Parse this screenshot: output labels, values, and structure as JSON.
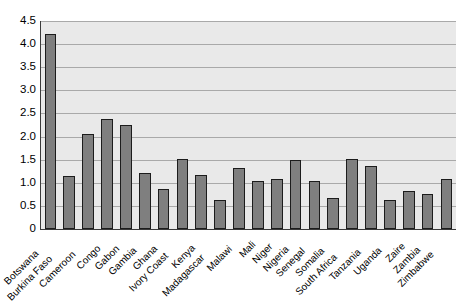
{
  "chart_data": {
    "type": "bar",
    "title": "",
    "subtitle": "",
    "xlabel": "",
    "ylabel": "",
    "ylim": [
      0,
      4.5
    ],
    "grid": true,
    "legend": false,
    "legend_position": "none",
    "orientation": "vertical",
    "bar_color": "#7f7f7f",
    "bar_edge_color": "#1c1c1c",
    "plot_background": "#e9e9e9",
    "gridline_color": "#a9a9a9",
    "axis_color": "#3a3a3a",
    "y_ticks": [
      "0",
      "0.5",
      "1.0",
      "1.5",
      "2.0",
      "2.5",
      "3.0",
      "3.5",
      "4.0",
      "4.5"
    ],
    "y_tick_values": [
      0,
      0.5,
      1.0,
      1.5,
      2.0,
      2.5,
      3.0,
      3.5,
      4.0,
      4.5
    ],
    "categories": [
      "Botswana",
      "Burkina Faso",
      "Cameroon",
      "Congo",
      "Gabon",
      "Gambia",
      "Ghana",
      "Ivory Coast",
      "Kenya",
      "Madagascar",
      "Malawi",
      "Mali",
      "Niger",
      "Nigeria",
      "Senegal",
      "Somalia",
      "South Africa",
      "Tanzania",
      "Uganda",
      "Zaire",
      "Zambia",
      "Zimbabwe"
    ],
    "values": [
      4.21,
      1.15,
      2.05,
      2.38,
      2.26,
      1.22,
      0.87,
      1.52,
      1.17,
      0.62,
      1.31,
      1.03,
      1.08,
      1.5,
      1.03,
      0.68,
      1.52,
      1.37,
      0.62,
      0.82,
      0.75,
      1.08
    ]
  }
}
